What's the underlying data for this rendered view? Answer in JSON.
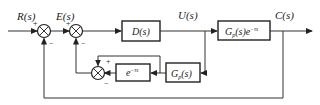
{
  "diagram": {
    "type": "block-diagram",
    "signals": {
      "input": "R(s)",
      "error": "E(s)",
      "control": "U(s)",
      "output": "C(s)"
    },
    "blocks": {
      "controller": {
        "label": "D(s)"
      },
      "plant": {
        "label_main": "G",
        "label_sub": "p",
        "label_rest": "(s)e",
        "label_sup": "−τs"
      },
      "delay": {
        "label_main": "e",
        "label_sup": "−τs"
      },
      "model": {
        "label_main": "G",
        "label_sub": "p",
        "label_rest": "(s)"
      }
    },
    "summing_junctions": {
      "sum1": {
        "plus": "+",
        "minus": "−"
      },
      "sum2": {
        "plus": "+",
        "minus": "−"
      },
      "sum3": {
        "plus": "+",
        "minus": "−"
      }
    },
    "colors": {
      "line": "#333333",
      "background": "#ffffff"
    }
  }
}
